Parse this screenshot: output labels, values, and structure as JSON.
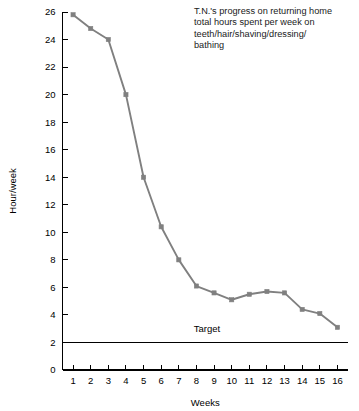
{
  "chart_data": {
    "type": "line",
    "title": "",
    "xlabel": "Weeks",
    "ylabel": "Hour/week",
    "xlim": [
      0.4,
      16.6
    ],
    "ylim": [
      0,
      26
    ],
    "grid": false,
    "legend_position": "none",
    "x": [
      1,
      2,
      3,
      4,
      5,
      6,
      7,
      8,
      9,
      10,
      11,
      12,
      13,
      14,
      15,
      16
    ],
    "categories": [
      "1",
      "2",
      "3",
      "4",
      "5",
      "6",
      "7",
      "8",
      "9",
      "10",
      "11",
      "12",
      "13",
      "14",
      "15",
      "16"
    ],
    "series": [
      {
        "name": "Total hours per week on self-care",
        "color": "#808080",
        "marker": "square",
        "values": [
          25.8,
          24.8,
          24.0,
          20.0,
          14.0,
          10.4,
          8.0,
          6.1,
          5.6,
          5.1,
          5.5,
          5.7,
          5.6,
          4.4,
          4.1,
          3.1
        ]
      }
    ],
    "reference_lines": [
      {
        "name": "target",
        "label": "Target",
        "orientation": "horizontal",
        "value": 2,
        "color": "#000000",
        "label_x": 8.6,
        "label_y": 3.0
      }
    ],
    "ytick_values": [
      0,
      2,
      4,
      6,
      8,
      10,
      12,
      14,
      16,
      18,
      20,
      22,
      24,
      26
    ],
    "ytick_labels": [
      "0",
      "2",
      "4",
      "6",
      "8",
      "10",
      "12",
      "14",
      "16",
      "18",
      "20",
      "22",
      "24",
      "26"
    ],
    "xtick_values": [
      1,
      2,
      3,
      4,
      5,
      6,
      7,
      8,
      9,
      10,
      11,
      12,
      13,
      14,
      15,
      16
    ],
    "xtick_labels": [
      "1",
      "2",
      "3",
      "4",
      "5",
      "6",
      "7",
      "8",
      "9",
      "10",
      "11",
      "12",
      "13",
      "14",
      "15",
      "16"
    ],
    "annotation": {
      "lines": [
        "T.N.'s progress on returning home",
        "total hours spent per week on",
        "teeth/hair/shaving/dressing/",
        "bathing"
      ]
    }
  },
  "colors": {
    "series": "#808080",
    "axis": "#000000",
    "target": "#000000",
    "background": "#ffffff"
  }
}
